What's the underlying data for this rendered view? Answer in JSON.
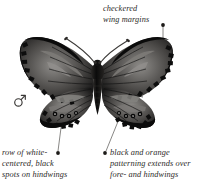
{
  "figure": {
    "background_color": "#ffffff",
    "ink_color": "#2c2a28"
  },
  "specimen": {
    "sex_symbol_name": "male-symbol",
    "sex_symbol_glyph": "♂",
    "body_color": "#151515",
    "wing_dark_color": "#101010",
    "wing_mid_color": "#6e6c6a",
    "wing_light_color": "#a9a7a4"
  },
  "callouts": [
    {
      "id": "checkered-wing-margins",
      "lines": [
        "checkered",
        "wing margins"
      ],
      "dot": {
        "x": 163,
        "y": 25
      },
      "leader_end": {
        "x": 163,
        "y": 50
      }
    },
    {
      "id": "white-centered-black-spots",
      "lines": [
        "row of white-",
        "centered, black",
        "spots on hindwings"
      ],
      "dot": {
        "x": 58,
        "y": 153
      },
      "leader_end": {
        "x": 61,
        "y": 121
      }
    },
    {
      "id": "black-and-orange-patterning",
      "lines": [
        "black and orange",
        "patterning extends over",
        "fore- and hindwings"
      ],
      "dot": {
        "x": 105,
        "y": 153
      },
      "leader_end": {
        "x": 118,
        "y": 120
      }
    }
  ]
}
